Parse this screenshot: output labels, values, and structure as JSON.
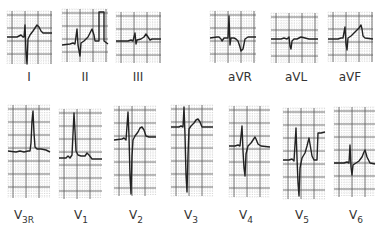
{
  "figure": {
    "grid": {
      "major_color": "#555555",
      "minor_color": "#9a9a9a",
      "trace_color": "#222222",
      "major_px": 13
    },
    "limb_leads": [
      {
        "id": "I",
        "label": "I",
        "box": [
          7,
          11,
          45,
          53
        ],
        "label_xy": [
          29,
          71
        ],
        "trace": [
          [
            0,
            26
          ],
          [
            10,
            26
          ],
          [
            12,
            25
          ],
          [
            14,
            24
          ],
          [
            16,
            26
          ],
          [
            17,
            26
          ],
          [
            18,
            14
          ],
          [
            19,
            41
          ],
          [
            20,
            53
          ],
          [
            21,
            28
          ],
          [
            23,
            24
          ],
          [
            26,
            20
          ],
          [
            28,
            17
          ],
          [
            30,
            14
          ],
          [
            32,
            16
          ],
          [
            34,
            20
          ],
          [
            36,
            22
          ],
          [
            40,
            22
          ],
          [
            45,
            22
          ]
        ]
      },
      {
        "id": "II",
        "label": "II",
        "box": [
          62,
          9,
          46,
          53
        ],
        "label_xy": [
          85,
          71
        ],
        "trace": [
          [
            0,
            36
          ],
          [
            8,
            35
          ],
          [
            11,
            34
          ],
          [
            13,
            35
          ],
          [
            15,
            20
          ],
          [
            16,
            36
          ],
          [
            18,
            47
          ],
          [
            19,
            34
          ],
          [
            22,
            32
          ],
          [
            26,
            28
          ],
          [
            28,
            24
          ],
          [
            30,
            20
          ],
          [
            32,
            26
          ],
          [
            33,
            32
          ],
          [
            35,
            32
          ],
          [
            37,
            32
          ],
          [
            37,
            3
          ],
          [
            42,
            3
          ],
          [
            42,
            32
          ],
          [
            46,
            35
          ]
        ]
      },
      {
        "id": "III",
        "label": "III",
        "box": [
          116,
          12,
          45,
          51
        ],
        "label_xy": [
          138,
          71
        ],
        "trace": [
          [
            0,
            29
          ],
          [
            12,
            29
          ],
          [
            15,
            28
          ],
          [
            17,
            29
          ],
          [
            19,
            21
          ],
          [
            20,
            32
          ],
          [
            21,
            28
          ],
          [
            25,
            27
          ],
          [
            28,
            25
          ],
          [
            30,
            22
          ],
          [
            32,
            25
          ],
          [
            34,
            28
          ],
          [
            36,
            27
          ],
          [
            38,
            27
          ],
          [
            45,
            27
          ]
        ]
      },
      {
        "id": "aVR",
        "label": "aVR",
        "box": [
          210,
          11,
          46,
          52
        ],
        "label_xy": [
          240,
          71
        ],
        "trace": [
          [
            0,
            27
          ],
          [
            7,
            26
          ],
          [
            9,
            26
          ],
          [
            11,
            28
          ],
          [
            12,
            30
          ],
          [
            14,
            27
          ],
          [
            18,
            27
          ],
          [
            19,
            5
          ],
          [
            20,
            34
          ],
          [
            21,
            27
          ],
          [
            24,
            27
          ],
          [
            26,
            28
          ],
          [
            28,
            30
          ],
          [
            30,
            36
          ],
          [
            31,
            40
          ],
          [
            33,
            38
          ],
          [
            35,
            28
          ],
          [
            38,
            26
          ],
          [
            46,
            26
          ]
        ]
      },
      {
        "id": "aVL",
        "label": "aVL",
        "box": [
          271,
          13,
          47,
          50
        ],
        "label_xy": [
          296,
          71
        ],
        "trace": [
          [
            0,
            26
          ],
          [
            10,
            26
          ],
          [
            13,
            25
          ],
          [
            16,
            26
          ],
          [
            18,
            24
          ],
          [
            19,
            33
          ],
          [
            20,
            36
          ],
          [
            21,
            28
          ],
          [
            23,
            26
          ],
          [
            26,
            26
          ],
          [
            28,
            25
          ],
          [
            30,
            24
          ],
          [
            34,
            25
          ],
          [
            38,
            26
          ],
          [
            47,
            26
          ]
        ]
      },
      {
        "id": "aVF",
        "label": "aVF",
        "box": [
          328,
          12,
          45,
          50
        ],
        "label_xy": [
          350,
          71
        ],
        "trace": [
          [
            0,
            27
          ],
          [
            10,
            27
          ],
          [
            13,
            26
          ],
          [
            15,
            26
          ],
          [
            17,
            15
          ],
          [
            18,
            32
          ],
          [
            19,
            38
          ],
          [
            20,
            26
          ],
          [
            23,
            24
          ],
          [
            27,
            20
          ],
          [
            31,
            16
          ],
          [
            33,
            13
          ],
          [
            34,
            17
          ],
          [
            35,
            24
          ],
          [
            37,
            26
          ],
          [
            45,
            27
          ]
        ]
      }
    ],
    "precordial_leads": [
      {
        "id": "V3R",
        "label": "V",
        "sub": "3R",
        "box": [
          8,
          105,
          42,
          93
        ],
        "label_xy": [
          24,
          209
        ],
        "trace": [
          [
            0,
            46
          ],
          [
            8,
            47
          ],
          [
            12,
            46
          ],
          [
            16,
            47
          ],
          [
            20,
            46
          ],
          [
            22,
            46
          ],
          [
            23,
            38
          ],
          [
            24,
            16
          ],
          [
            25,
            6
          ],
          [
            26,
            28
          ],
          [
            27,
            42
          ],
          [
            29,
            44
          ],
          [
            33,
            44
          ],
          [
            38,
            45
          ],
          [
            42,
            47
          ]
        ]
      },
      {
        "id": "V1",
        "label": "V",
        "sub": "1",
        "box": [
          59,
          109,
          43,
          90
        ],
        "label_xy": [
          81,
          209
        ],
        "trace": [
          [
            0,
            49
          ],
          [
            7,
            49
          ],
          [
            9,
            47
          ],
          [
            11,
            49
          ],
          [
            13,
            46
          ],
          [
            14,
            25
          ],
          [
            15,
            4
          ],
          [
            16,
            22
          ],
          [
            17,
            42
          ],
          [
            19,
            46
          ],
          [
            22,
            47
          ],
          [
            26,
            47
          ],
          [
            28,
            44
          ],
          [
            30,
            46
          ],
          [
            33,
            50
          ],
          [
            43,
            50
          ]
        ]
      },
      {
        "id": "V2",
        "label": "V",
        "sub": "2",
        "box": [
          114,
          106,
          42,
          90
        ],
        "label_xy": [
          136,
          209
        ],
        "trace": [
          [
            0,
            34
          ],
          [
            8,
            33
          ],
          [
            10,
            32
          ],
          [
            12,
            34
          ],
          [
            14,
            6
          ],
          [
            15,
            30
          ],
          [
            16,
            70
          ],
          [
            17,
            88
          ],
          [
            18,
            50
          ],
          [
            19,
            34
          ],
          [
            21,
            30
          ],
          [
            24,
            26
          ],
          [
            26,
            22
          ],
          [
            28,
            21
          ],
          [
            30,
            24
          ],
          [
            32,
            30
          ],
          [
            35,
            31
          ],
          [
            42,
            31
          ]
        ]
      },
      {
        "id": "V3",
        "label": "V",
        "sub": "3",
        "box": [
          171,
          105,
          42,
          91
        ],
        "label_xy": [
          191,
          209
        ],
        "trace": [
          [
            0,
            22
          ],
          [
            8,
            22
          ],
          [
            10,
            21
          ],
          [
            12,
            22
          ],
          [
            13,
            2
          ],
          [
            14,
            30
          ],
          [
            15,
            70
          ],
          [
            16,
            87
          ],
          [
            17,
            50
          ],
          [
            18,
            24
          ],
          [
            20,
            21
          ],
          [
            23,
            18
          ],
          [
            25,
            15
          ],
          [
            27,
            14
          ],
          [
            29,
            17
          ],
          [
            31,
            22
          ],
          [
            34,
            22
          ],
          [
            42,
            22
          ]
        ]
      },
      {
        "id": "V4",
        "label": "V",
        "sub": "4",
        "box": [
          229,
          106,
          41,
          91
        ],
        "label_xy": [
          246,
          209
        ],
        "trace": [
          [
            0,
            40
          ],
          [
            6,
            40
          ],
          [
            9,
            39
          ],
          [
            11,
            40
          ],
          [
            13,
            20
          ],
          [
            14,
            45
          ],
          [
            15,
            62
          ],
          [
            16,
            70
          ],
          [
            17,
            48
          ],
          [
            19,
            40
          ],
          [
            22,
            37
          ],
          [
            24,
            34
          ],
          [
            26,
            31
          ],
          [
            27,
            33
          ],
          [
            29,
            38
          ],
          [
            32,
            40
          ],
          [
            41,
            41
          ]
        ]
      },
      {
        "id": "V5",
        "label": "V",
        "sub": "5",
        "box": [
          283,
          108,
          42,
          91
        ],
        "label_xy": [
          302,
          209
        ],
        "trace": [
          [
            0,
            52
          ],
          [
            6,
            52
          ],
          [
            9,
            51
          ],
          [
            11,
            53
          ],
          [
            13,
            20
          ],
          [
            14,
            50
          ],
          [
            15,
            75
          ],
          [
            16,
            88
          ],
          [
            17,
            60
          ],
          [
            19,
            50
          ],
          [
            22,
            45
          ],
          [
            24,
            38
          ],
          [
            26,
            30
          ],
          [
            27,
            36
          ],
          [
            29,
            48
          ],
          [
            31,
            52
          ],
          [
            34,
            52
          ],
          [
            35,
            25
          ],
          [
            38,
            25
          ],
          [
            42,
            24
          ]
        ]
      },
      {
        "id": "V6",
        "label": "V",
        "sub": "6",
        "box": [
          334,
          107,
          41,
          90
        ],
        "label_xy": [
          356,
          209
        ],
        "trace": [
          [
            0,
            56
          ],
          [
            10,
            56
          ],
          [
            13,
            55
          ],
          [
            15,
            56
          ],
          [
            16,
            38
          ],
          [
            17,
            60
          ],
          [
            18,
            68
          ],
          [
            19,
            58
          ],
          [
            22,
            56
          ],
          [
            25,
            54
          ],
          [
            28,
            50
          ],
          [
            30,
            45
          ],
          [
            31,
            43
          ],
          [
            33,
            50
          ],
          [
            36,
            56
          ],
          [
            41,
            57
          ]
        ]
      }
    ]
  }
}
